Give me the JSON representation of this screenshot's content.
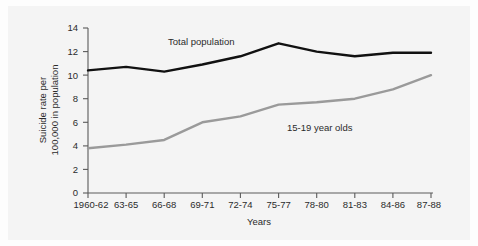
{
  "figure": {
    "background_color": "#f4f4f4",
    "page_color": "#fdfdfd"
  },
  "chart_data": {
    "type": "line",
    "title": "",
    "xlabel": "Years",
    "ylabel": "Suicide rate per 100,000 in population",
    "ylabel_line1": "Suicide rate per",
    "ylabel_line2": "100,000 in population",
    "categories": [
      "1960-62",
      "63-65",
      "66-68",
      "69-71",
      "72-74",
      "75-77",
      "78-80",
      "81-83",
      "84-86",
      "87-88"
    ],
    "ylim": [
      0,
      14
    ],
    "yticks": [
      "0",
      "2",
      "4",
      "6",
      "8",
      "10",
      "12",
      "14"
    ],
    "ytick_values": [
      0,
      2,
      4,
      6,
      8,
      10,
      12,
      14
    ],
    "grid": false,
    "legend_position": "inline-annotation",
    "series": [
      {
        "name": "Total population",
        "color": "#111111",
        "line_width": 2.4,
        "values": [
          10.4,
          10.7,
          10.3,
          10.9,
          11.6,
          12.7,
          12.0,
          11.6,
          11.9,
          11.9
        ]
      },
      {
        "name": "15-19 year olds",
        "color": "#9a9a9a",
        "line_width": 2.4,
        "values": [
          3.8,
          4.1,
          4.5,
          6.0,
          6.5,
          7.5,
          7.7,
          8.0,
          8.8,
          10.0
        ]
      }
    ],
    "annotations": [
      {
        "text": "Total population",
        "x_category": "69-71",
        "y_value": 12.6
      },
      {
        "text": "15-19 year olds",
        "x_category": "78-80",
        "y_value": 6.4
      }
    ]
  }
}
